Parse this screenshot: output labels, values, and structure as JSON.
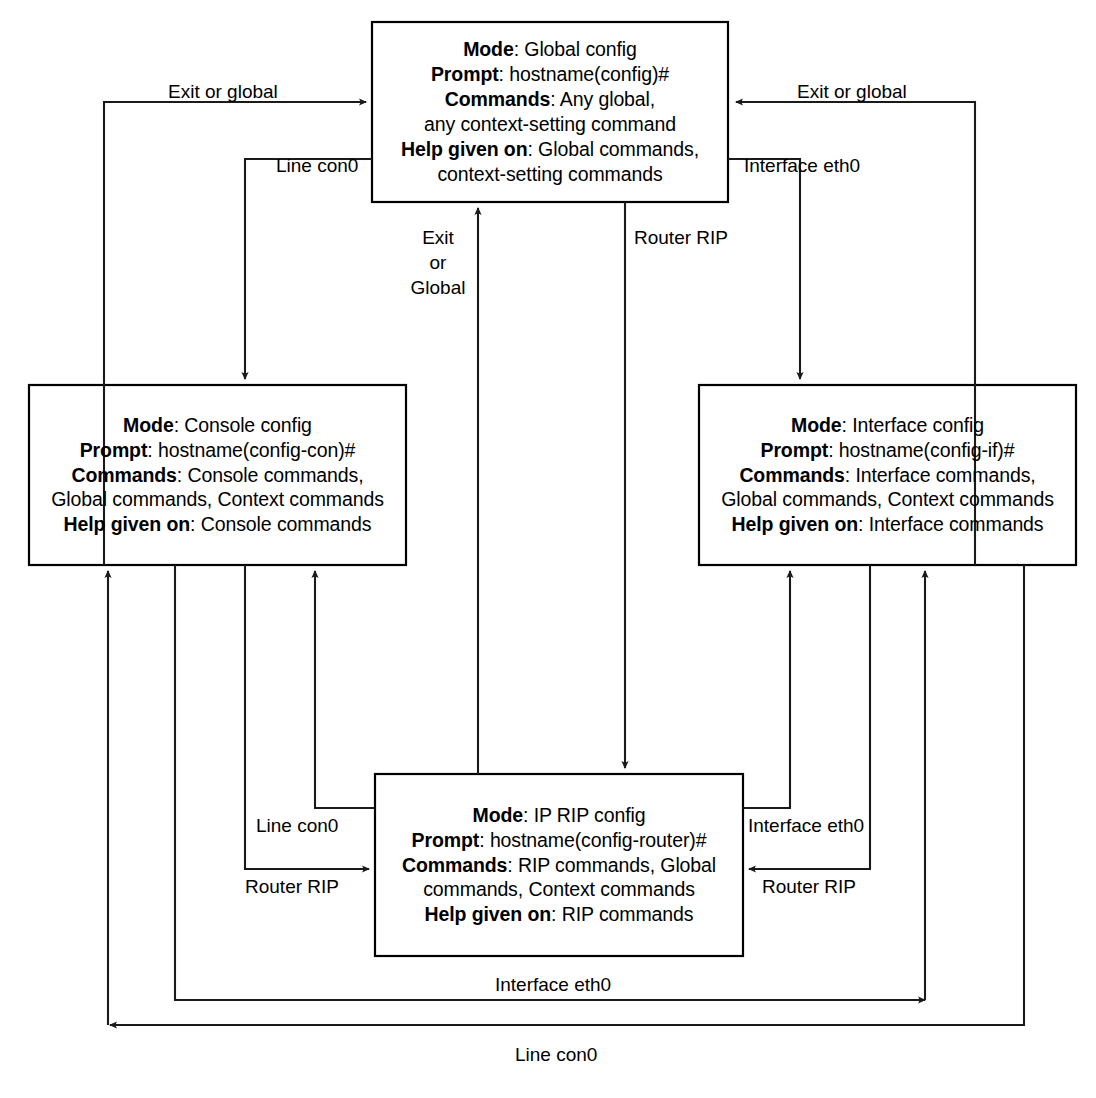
{
  "diagram": {
    "stroke_color": "#1a1a1a",
    "box_fill": "#ffffff",
    "boxes": [
      {
        "id": "global-config",
        "name": "global-config-box",
        "mode_label": "Mode",
        "mode_value": "Global config",
        "prompt_label": "Prompt",
        "prompt_value": "hostname(config)#",
        "commands_label": "Commands",
        "commands_value": "Any global,",
        "commands_value_2": "any context-setting command",
        "help_label": "Help given on",
        "help_value": "Global commands,",
        "help_value_2": "context-setting commands"
      },
      {
        "id": "console-config",
        "name": "console-config-box",
        "mode_label": "Mode",
        "mode_value": "Console config",
        "prompt_label": "Prompt",
        "prompt_value": "hostname(config-con)#",
        "commands_label": "Commands",
        "commands_value": "Console commands,",
        "commands_value_2": "Global commands, Context commands",
        "help_label": "Help given on",
        "help_value": "Console commands"
      },
      {
        "id": "interface-config",
        "name": "interface-config-box",
        "mode_label": "Mode",
        "mode_value": "Interface config",
        "prompt_label": "Prompt",
        "prompt_value": "hostname(config-if)#",
        "commands_label": "Commands",
        "commands_value": "Interface commands,",
        "commands_value_2": "Global commands, Context commands",
        "help_label": "Help given on",
        "help_value": "Interface commands"
      },
      {
        "id": "rip-config",
        "name": "rip-config-box",
        "mode_label": "Mode",
        "mode_value": "IP RIP config",
        "prompt_label": "Prompt",
        "prompt_value": "hostname(config-router)#",
        "commands_label": "Commands",
        "commands_value": "RIP commands, Global",
        "commands_value_2": "commands, Context commands",
        "help_label": "Help given on",
        "help_value": "RIP commands"
      }
    ],
    "edge_labels": {
      "exit_or_global_left": "Exit or global",
      "exit_or_global_right": "Exit or global",
      "line_con0_top": "Line con0",
      "interface_eth0_top": "Interface eth0",
      "exit_or_global_center_1": "Exit",
      "exit_or_global_center_2": "or",
      "exit_or_global_center_3": "Global",
      "router_rip_center": "Router RIP",
      "line_con0_mid_left": "Line con0",
      "router_rip_mid_left": "Router RIP",
      "interface_eth0_mid_right": "Interface eth0",
      "router_rip_mid_right": "Router RIP",
      "interface_eth0_bottom": "Interface eth0",
      "line_con0_bottom": "Line con0"
    }
  }
}
